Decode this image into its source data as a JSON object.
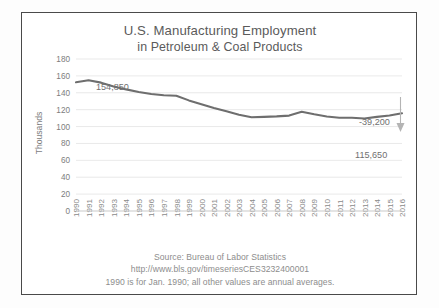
{
  "figure": {
    "background_color": "#fdfdfd",
    "frame_color": "#4a4a4a",
    "panel_color": "#ffffff"
  },
  "title": {
    "line1": "U.S. Manufacturing Employment",
    "line2": "in Petroleum & Coal Products",
    "color": "#5b5b5b"
  },
  "footnotes": {
    "source": "Source: Bureau of Labor Statistics",
    "url": "http://www.bls.gov/timeseriesCES3232400001",
    "note": "1990 is for Jan. 1990; all other values are annual averages."
  },
  "annotations": {
    "peak_label": "154,850",
    "change_label": "-39,200",
    "end_label": "115,650"
  },
  "chart_data": {
    "type": "line",
    "title": "U.S. Manufacturing Employment in Petroleum & Coal Products",
    "xlabel": "",
    "ylabel": "Thousands",
    "ylim": [
      0,
      180
    ],
    "ytick_step": 20,
    "yticks": [
      0,
      20,
      40,
      60,
      80,
      100,
      120,
      140,
      160,
      180
    ],
    "grid": true,
    "legend": "none",
    "line_color": "#6e6e6e",
    "categories": [
      "1990",
      "1991",
      "1992",
      "1993",
      "1994",
      "1995",
      "1996",
      "1997",
      "1998",
      "1999",
      "2000",
      "2001",
      "2002",
      "2003",
      "2004",
      "2005",
      "2006",
      "2007",
      "2008",
      "2009",
      "2010",
      "2011",
      "2012",
      "2013",
      "2014",
      "2015",
      "2016"
    ],
    "series": [
      {
        "name": "Petroleum & Coal Products employment (thousands)",
        "values": [
          152.5,
          154.85,
          152.0,
          147.5,
          144.0,
          141.0,
          138.5,
          137.0,
          136.5,
          131.0,
          126.5,
          122.0,
          118.0,
          114.0,
          111.0,
          111.5,
          112.0,
          113.0,
          117.5,
          114.5,
          112.0,
          110.5,
          110.5,
          109.5,
          111.5,
          113.0,
          115.65
        ]
      }
    ],
    "annotations": [
      {
        "text": "154,850",
        "x": "1991",
        "y": 154.85,
        "kind": "point-label"
      },
      {
        "text": "-39,200",
        "kind": "change-arrow"
      },
      {
        "text": "115,650",
        "x": "2016",
        "y": 115.65,
        "kind": "point-label"
      }
    ]
  }
}
